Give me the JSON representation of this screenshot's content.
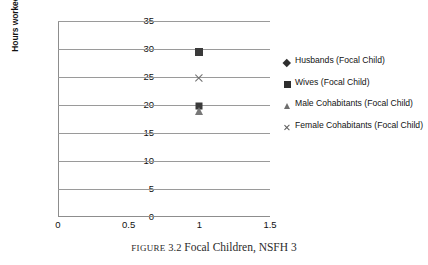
{
  "chart_data": {
    "type": "scatter",
    "title": "",
    "xlabel": "",
    "ylabel": "Hours worked per week",
    "xlim": [
      0,
      1.5
    ],
    "ylim": [
      0,
      35
    ],
    "x_ticks": [
      "0",
      "0.5",
      "1",
      "1.5"
    ],
    "x_tick_values": [
      0,
      0.5,
      1,
      1.5
    ],
    "y_ticks": [
      "0",
      "5",
      "10",
      "15",
      "20",
      "25",
      "30",
      "35"
    ],
    "y_tick_values": [
      0,
      5,
      10,
      15,
      20,
      25,
      30,
      35
    ],
    "grid": "horizontal",
    "legend_position": "right",
    "series": [
      {
        "name": "Husbands (Focal Child)",
        "marker": "diamond",
        "color": "#3a3a3a",
        "points": [
          {
            "x": 1,
            "y": 19.9
          }
        ]
      },
      {
        "name": "Wives (Focal Child)",
        "marker": "square",
        "color": "#3a3a3a",
        "points": [
          {
            "x": 1,
            "y": 29.5
          }
        ]
      },
      {
        "name": "Male Cohabitants (Focal Child)",
        "marker": "triangle",
        "color": "#787878",
        "points": [
          {
            "x": 1,
            "y": 19.0
          }
        ]
      },
      {
        "name": "Female Cohabitants (Focal Child)",
        "marker": "x",
        "color": "#6f6f6f",
        "points": [
          {
            "x": 1,
            "y": 24.8
          }
        ]
      }
    ]
  },
  "legend": {
    "entries": [
      {
        "label": "Husbands (Focal Child)",
        "marker": "diamond"
      },
      {
        "label": "Wives (Focal Child)",
        "marker": "square"
      },
      {
        "label": "Male Cohabitants (Focal Child)",
        "marker": "triangle"
      },
      {
        "label": "Female Cohabitants (Focal Child)",
        "marker": "x"
      }
    ]
  },
  "caption": {
    "figure_word": "FIGURE",
    "figure_number": "3.2",
    "text": "Focal Children, NSFH 3"
  }
}
